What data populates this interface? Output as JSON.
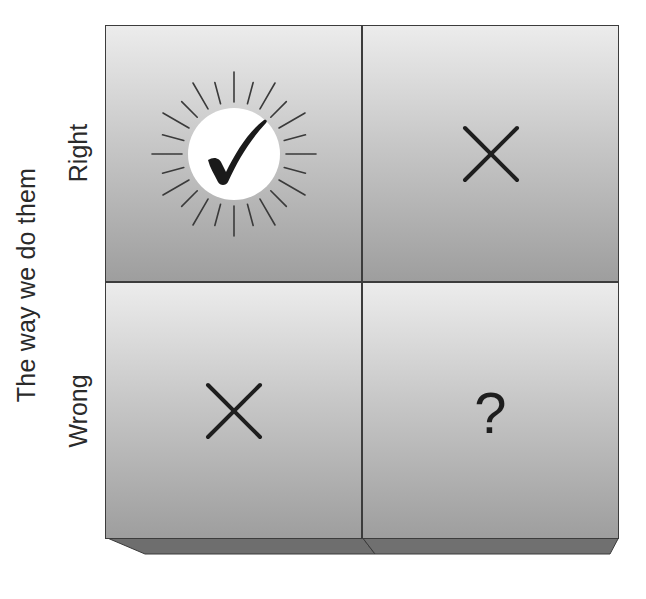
{
  "diagram": {
    "type": "2x2 matrix",
    "axis_title": "The way we do them",
    "rows": [
      {
        "label": "Right"
      },
      {
        "label": "Wrong"
      }
    ],
    "cells": [
      {
        "row": "Right",
        "col": 1,
        "symbol": "check-sunburst-icon",
        "meaning": "correct"
      },
      {
        "row": "Right",
        "col": 2,
        "symbol": "x-icon",
        "meaning": "incorrect"
      },
      {
        "row": "Wrong",
        "col": 1,
        "symbol": "x-icon",
        "meaning": "incorrect"
      },
      {
        "row": "Wrong",
        "col": 2,
        "symbol": "question-icon",
        "text": "?"
      }
    ],
    "colors": {
      "cell_top": "#ececec",
      "cell_bottom": "#9e9e9e",
      "border": "#3c3c3c",
      "bevel": "#6e6e6e",
      "symbol": "#1e1e1e",
      "text": "#2a2a2a"
    }
  }
}
